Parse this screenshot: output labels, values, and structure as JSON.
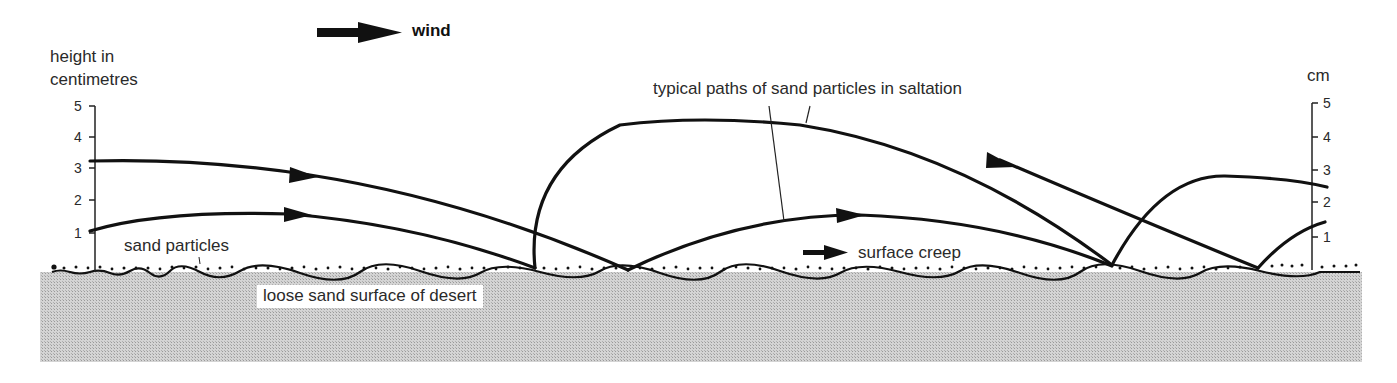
{
  "diagram": {
    "title_wind": "wind",
    "left_axis": {
      "label_line1": "height in",
      "label_line2": "centimetres",
      "ticks": [
        "5",
        "4",
        "3",
        "2",
        "1"
      ]
    },
    "right_axis": {
      "label": "cm",
      "ticks": [
        "5",
        "4",
        "3",
        "2",
        "1"
      ]
    },
    "labels": {
      "saltation": "typical paths of sand particles in saltation",
      "sand_particles": "sand particles",
      "surface_creep": "surface creep",
      "ground": "loose sand surface of desert"
    },
    "colors": {
      "line": "#111111",
      "ground_fill": "#c8c8c8",
      "text": "#2a2a2a"
    }
  }
}
